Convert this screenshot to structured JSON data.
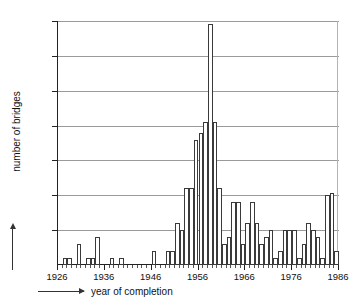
{
  "chart_data": {
    "type": "bar",
    "title": "",
    "xlabel": "year of completion",
    "ylabel": "number of bridges",
    "ylim": [
      0,
      35
    ],
    "xlim": [
      1926,
      1986
    ],
    "ytick_labels": [
      "5",
      "10",
      "15",
      "20",
      "25",
      "30",
      "35"
    ],
    "ytick_values": [
      5,
      10,
      15,
      20,
      25,
      30,
      35
    ],
    "xtick_labels": [
      "1926",
      "1936",
      "1946",
      "1956",
      "1966",
      "1976",
      "1986"
    ],
    "xtick_values": [
      1926,
      1936,
      1946,
      1956,
      1966,
      1976,
      1986
    ],
    "grid": true,
    "legend": "none",
    "bar_fill": "#ffffff",
    "bar_edge": "#3a3a3a",
    "grid_color": "#9a9a9a",
    "axis_color": "#222222",
    "categories": [
      1926,
      1927,
      1928,
      1929,
      1930,
      1931,
      1932,
      1933,
      1934,
      1935,
      1936,
      1937,
      1938,
      1939,
      1940,
      1941,
      1942,
      1943,
      1944,
      1945,
      1946,
      1947,
      1948,
      1949,
      1950,
      1951,
      1952,
      1953,
      1954,
      1955,
      1956,
      1957,
      1958,
      1959,
      1960,
      1961,
      1962,
      1963,
      1964,
      1965,
      1966,
      1967,
      1968,
      1969,
      1970,
      1971,
      1972,
      1973,
      1974,
      1975,
      1976,
      1977,
      1978,
      1979,
      1980,
      1981,
      1982,
      1983,
      1984,
      1985
    ],
    "values": [
      0,
      1,
      1,
      0,
      3,
      0,
      1,
      1,
      4,
      0,
      0,
      1,
      0,
      1,
      0,
      0,
      0,
      0,
      0,
      0,
      2,
      0,
      0,
      2,
      2,
      6,
      5,
      11,
      11,
      18,
      19,
      20.5,
      34.5,
      20.5,
      11,
      3,
      4,
      9,
      9,
      3,
      6,
      9,
      6,
      3,
      4,
      5,
      1,
      2,
      5,
      5,
      5,
      1,
      3,
      6,
      5,
      4,
      1,
      10,
      10.3,
      2
    ]
  }
}
